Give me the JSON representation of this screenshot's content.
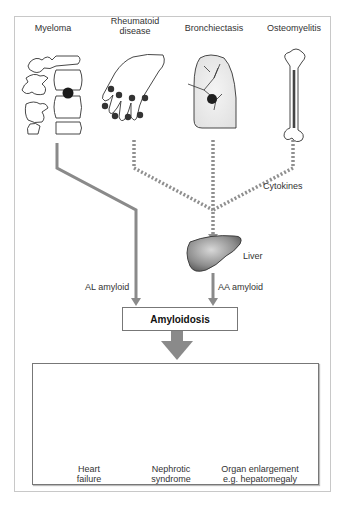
{
  "diagram": {
    "sources": [
      {
        "id": "myeloma",
        "label": "Myeloma",
        "image": "vertebra-with-lesion"
      },
      {
        "id": "rheumatoid",
        "label_line1": "Rheumatoid",
        "label_line2": "disease",
        "image": "hand-with-inflamed-joints"
      },
      {
        "id": "bronchiectasis",
        "label": "Bronchiectasis",
        "image": "lung"
      },
      {
        "id": "osteomyelitis",
        "label": "Osteomyelitis",
        "image": "long-bone"
      }
    ],
    "edges": {
      "cytokines_label": "Cytokines",
      "liver_label": "Liver",
      "al_label": "AL amyloid",
      "aa_label": "AA amyloid"
    },
    "central_node": "Amyloidosis",
    "outcomes": [
      {
        "id": "heart",
        "line1": "Heart",
        "line2": "failure"
      },
      {
        "id": "kidney",
        "line1": "Nephrotic",
        "line2": "syndrome"
      },
      {
        "id": "liver",
        "line1": "Organ enlargement",
        "line2": "e.g. hepatomegaly"
      }
    ],
    "colors": {
      "arrow": "#8a8a8a",
      "dotted": "#8f8f8f",
      "organ_fill": "#9a9a9a",
      "border": "#777777"
    }
  }
}
